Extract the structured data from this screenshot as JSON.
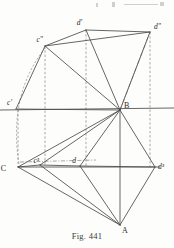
{
  "figure": {
    "caption": "Fig. 441",
    "kind": "descriptive-geometry-projection-diagram",
    "ink_color": "#4a4a4a",
    "dash_color": "#8b8b8b",
    "label_color": "#2b2b2b",
    "background": "#fdfdfb"
  },
  "labels": {
    "d_prime": "d'",
    "d_double_prime": "d\"",
    "c_double_prime": "c\"",
    "c_prime": "c'",
    "B": "B",
    "C": "C",
    "c_triple_prime": "c³",
    "d": "d",
    "d_triple_prime": "d³",
    "A": "A"
  },
  "points": {
    "d_prime": {
      "x": 86,
      "y": 30,
      "label_dx": -4,
      "label_dy": -5
    },
    "d_double_prime": {
      "x": 150,
      "y": 32,
      "label_dx": 4,
      "label_dy": -3
    },
    "c_double_prime": {
      "x": 45,
      "y": 46,
      "label_dx": -2,
      "label_dy": -4
    },
    "c_prime": {
      "x": 16,
      "y": 109,
      "label_dx": -4,
      "label_dy": -4
    },
    "B": {
      "x": 120,
      "y": 110,
      "label_dx": 4,
      "label_dy": -2
    },
    "C": {
      "x": 18,
      "y": 167,
      "label_dx": -12,
      "label_dy": 4
    },
    "c_triple_prime": {
      "x": 40,
      "y": 165,
      "label_dx": -1,
      "label_dy": -2
    },
    "d": {
      "x": 80,
      "y": 166,
      "label_dx": -4,
      "label_dy": -3
    },
    "d_triple_prime": {
      "x": 155,
      "y": 167,
      "label_dx": 3,
      "label_dy": 2
    },
    "A": {
      "x": 120,
      "y": 225,
      "label_dx": 2,
      "label_dy": 8
    }
  },
  "axes": {
    "upper_horizontal": {
      "x1": 0,
      "y1": 110,
      "x2": 174,
      "y2": 108
    },
    "lower_horizontal": {
      "x1": 18,
      "y1": 167,
      "x2": 160,
      "y2": 167
    }
  },
  "solid_edges": [
    [
      "c_double_prime",
      "d_prime"
    ],
    [
      "c_double_prime",
      "d_double_prime"
    ],
    [
      "d_prime",
      "d_double_prime"
    ],
    [
      "d_prime",
      "B"
    ],
    [
      "d_double_prime",
      "B"
    ],
    [
      "c_double_prime",
      "B"
    ],
    [
      "c_prime",
      "c_double_prime"
    ],
    [
      "c_prime",
      "B"
    ],
    [
      "B",
      "C"
    ],
    [
      "B",
      "c_triple_prime"
    ],
    [
      "B",
      "d"
    ],
    [
      "B",
      "d_triple_prime"
    ],
    [
      "B",
      "A"
    ],
    [
      "C",
      "c_triple_prime"
    ],
    [
      "c_triple_prime",
      "d"
    ],
    [
      "d",
      "d_triple_prime"
    ],
    [
      "C",
      "A"
    ],
    [
      "c_triple_prime",
      "A"
    ],
    [
      "d",
      "A"
    ],
    [
      "d_triple_prime",
      "A"
    ]
  ],
  "dashed_verticals": [
    {
      "name": "through-c-prime",
      "x": 18,
      "y1": 110,
      "y2": 167
    },
    {
      "name": "through-c-double-prime",
      "x": 45,
      "y1": 46,
      "y2": 165
    },
    {
      "name": "through-d-prime",
      "x": 86,
      "y1": 30,
      "y2": 166
    },
    {
      "name": "through-d-double-prime",
      "x": 150,
      "y1": 32,
      "y2": 167
    }
  ],
  "dash_dot_lines": [
    {
      "name": "B-to-d-double-prime-aux",
      "x1": 120,
      "y1": 110,
      "x2": 150,
      "y2": 32
    },
    {
      "name": "C-aux-to-c-triple",
      "x1": 20,
      "y1": 162,
      "x2": 96,
      "y2": 160
    }
  ],
  "arc": {
    "name": "rabatment-arc-c",
    "from_x": 45,
    "from_y": 48,
    "to_x": 19,
    "to_y": 164,
    "ctrl_x": 8,
    "ctrl_y": 95
  },
  "page_bleed": {
    "note": "faint cut-off descenders from text line above the figure",
    "marks": [
      {
        "x": 96,
        "y": 3,
        "w": 2,
        "h": 4
      },
      {
        "x": 112,
        "y": 2,
        "w": 3,
        "h": 5
      },
      {
        "x": 124,
        "y": 4,
        "w": 34,
        "h": 1
      },
      {
        "x": 160,
        "y": 2,
        "w": 4,
        "h": 4
      }
    ]
  }
}
